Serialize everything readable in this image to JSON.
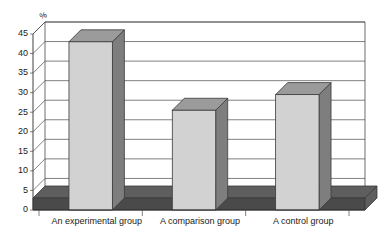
{
  "chart_data": {
    "type": "bar",
    "title": "",
    "subtitle": "",
    "xlabel": "",
    "ylabel": "%",
    "unit_label": "%",
    "categories": [
      "An experimental group",
      "A comparison group",
      "A control group"
    ],
    "values": [
      43,
      25.5,
      29.5
    ],
    "ylim": [
      0,
      45
    ],
    "ytick_step": 5,
    "yticks": [
      0,
      5,
      10,
      15,
      20,
      25,
      30,
      35,
      40,
      45
    ],
    "ytick_labels": [
      "0",
      "5",
      "10",
      "15",
      "20",
      "25",
      "30",
      "35",
      "40",
      "45"
    ],
    "grid": true,
    "grid_axis": "y",
    "legend": false,
    "legend_position": "none",
    "style": "3d-column",
    "annotations": [],
    "colors": {
      "bar_front": "#d2d2d2",
      "bar_top": "#9b9b9b",
      "bar_side": "#7e7e7e",
      "floor_top": "#5e5e5e",
      "floor_front": "#4a4a4a",
      "gridline": "#4a4a4a",
      "axis": "#2a2a2a",
      "text": "#1a1a1a",
      "background": "#ffffff"
    }
  }
}
